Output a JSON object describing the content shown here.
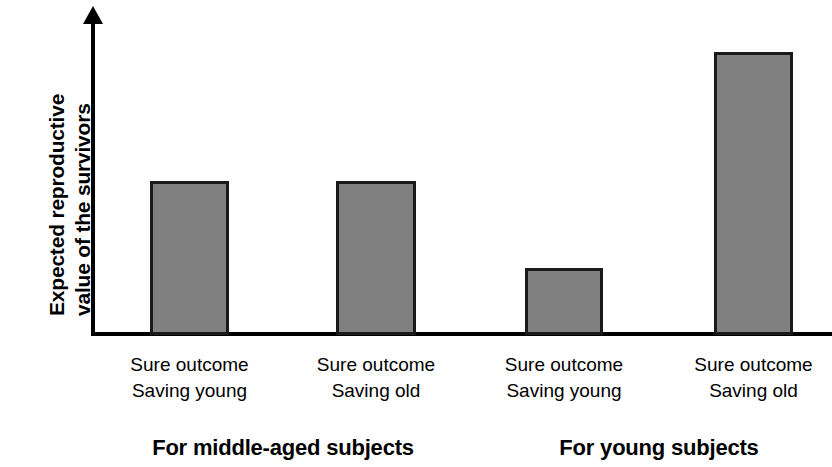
{
  "chart_data": {
    "type": "bar",
    "title": "",
    "subtitle": "",
    "xlabel": "",
    "ylabel": "Expected reproductive value of the survivors",
    "ylabel_lines": [
      "Expected reproductive",
      "value of the survivors"
    ],
    "grid": false,
    "legend": "none",
    "y_axis_has_arrow": true,
    "y_axis_ticks": [],
    "ylim": [
      0,
      100
    ],
    "bar_color": "#808080",
    "bar_edge_color": "#1a1a1a",
    "axis_color": "#000000",
    "background_color": "#ffffff",
    "categories": [
      "Sure outcome Saving young",
      "Sure outcome Saving old",
      "Sure outcome Saving young",
      "Sure outcome Saving old"
    ],
    "values": [
      54,
      54,
      23,
      100
    ],
    "bars": [
      {
        "index": 0,
        "group": "For middle-aged subjects",
        "condition_line1": "Sure outcome",
        "condition_line2": "Saving young",
        "value": 54,
        "left_px": 150,
        "top_px": 181,
        "width_px": 79,
        "height_px": 154
      },
      {
        "index": 1,
        "group": "For middle-aged subjects",
        "condition_line1": "Sure outcome",
        "condition_line2": "Saving old",
        "value": 54,
        "left_px": 336,
        "top_px": 181,
        "width_px": 80,
        "height_px": 154
      },
      {
        "index": 2,
        "group": "For young subjects",
        "condition_line1": "Sure outcome",
        "condition_line2": "Saving young",
        "value": 23,
        "left_px": 525,
        "top_px": 268,
        "width_px": 78,
        "height_px": 67
      },
      {
        "index": 3,
        "group": "For young subjects",
        "condition_line1": "Sure outcome",
        "condition_line2": "Saving old",
        "value": 100,
        "left_px": 714,
        "top_px": 52,
        "width_px": 79,
        "height_px": 283
      }
    ],
    "groups": [
      {
        "label": "For middle-aged subjects",
        "bar_indices": [
          0,
          1
        ]
      },
      {
        "label": "For young subjects",
        "bar_indices": [
          2,
          3
        ]
      }
    ]
  }
}
